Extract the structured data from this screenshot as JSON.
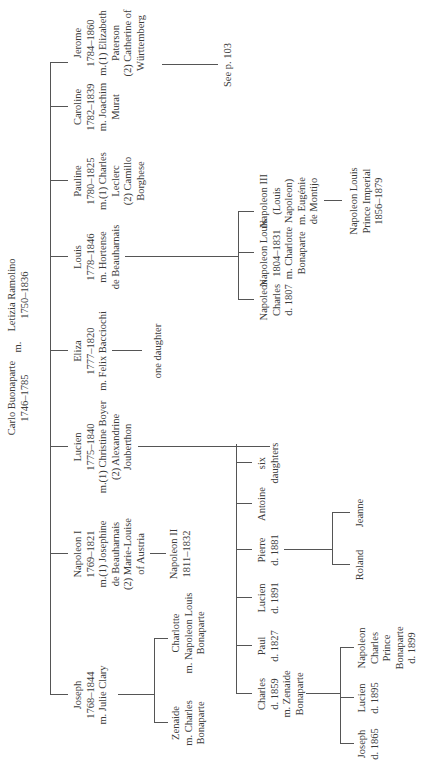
{
  "orientation": "rotated 90 degrees counter-clockwise",
  "parents": {
    "father": {
      "name": "Carlo Buonaparte",
      "dates": "1746–1785"
    },
    "marriage": "m.",
    "mother": {
      "name": "Letizia Ramolino",
      "dates": "1750–1836"
    }
  },
  "children": [
    {
      "id": "joseph",
      "lines": [
        "Joseph",
        "1768–1844",
        "m. Julie Clary"
      ]
    },
    {
      "id": "napoleon1",
      "lines": [
        "Napoleon I",
        "1769–1821",
        "m.(1) Josephine",
        "de Beauharnais",
        "(2) Marie-Louise",
        "of Austria"
      ]
    },
    {
      "id": "lucien",
      "lines": [
        "Lucien",
        "1775–1840",
        "m.(1) Christine Boyer",
        "(2) Alexandrine",
        "Jouberthon"
      ]
    },
    {
      "id": "eliza",
      "lines": [
        "Eliza",
        "1777–1820",
        "m. Felix Bacciochi"
      ]
    },
    {
      "id": "louis",
      "lines": [
        "Louis",
        "1778–1846",
        "m. Hortense",
        "de Beauharnais"
      ]
    },
    {
      "id": "pauline",
      "lines": [
        "Pauline",
        "1780–1825",
        "m.(1) Charles",
        "Leclerc",
        "(2) Camillo",
        "Borghese"
      ]
    },
    {
      "id": "caroline",
      "lines": [
        "Caroline",
        "1782–1839",
        "m. Joachim",
        "Murat"
      ]
    },
    {
      "id": "jerome",
      "lines": [
        "Jerome",
        "1784–1860",
        "m.(1) Elizabeth",
        "Paterson",
        "(2) Catherine of",
        "Württemberg"
      ]
    }
  ],
  "joseph_children": [
    {
      "lines": [
        "Zenaide",
        "m. Charles",
        "Bonaparte"
      ]
    },
    {
      "lines": [
        "Charlotte",
        "m. Napoleon Louis",
        "Bonaparte"
      ]
    }
  ],
  "napoleon1_children": [
    {
      "lines": [
        "Napoleon II",
        "1811–1832"
      ]
    }
  ],
  "lucien_children": [
    {
      "lines": [
        "Charles",
        "d. 1859",
        "m. Zenaide",
        "Bonaparte"
      ]
    },
    {
      "lines": [
        "Paul",
        "d. 1827"
      ]
    },
    {
      "lines": [
        "Lucien",
        "d. 1891"
      ]
    },
    {
      "lines": [
        "Pierre",
        "d. 1881"
      ]
    },
    {
      "lines": [
        "Antoine"
      ]
    },
    {
      "lines": [
        "six",
        "daughters"
      ]
    }
  ],
  "charles_children": [
    {
      "lines": [
        "Joseph",
        "d. 1865"
      ]
    },
    {
      "lines": [
        "Lucien",
        "d. 1895"
      ]
    },
    {
      "lines": [
        "Napoleon",
        "Charles",
        "Prince",
        "Bonaparte",
        "d. 1899"
      ]
    }
  ],
  "pierre_children": [
    {
      "lines": [
        "Roland"
      ]
    },
    {
      "lines": [
        "Jeanne"
      ]
    }
  ],
  "eliza_children": [
    {
      "lines": [
        "one daughter"
      ]
    }
  ],
  "louis_children": [
    {
      "lines": [
        "Napoleon",
        "Charles",
        "d. 1807"
      ]
    },
    {
      "lines": [
        "Napoleon Louis",
        "1804–1831",
        "m. Charlotte",
        "Bonaparte"
      ]
    },
    {
      "lines": [
        "Napoleon III",
        "(Louis",
        "Napoleon)",
        "m. Eugénie",
        "de Montijo"
      ]
    }
  ],
  "napoleon3_children": [
    {
      "lines": [
        "Napoleon Louis",
        "Prince Imperial",
        "1856–1879"
      ]
    }
  ],
  "jerome_reference": "See p. 103"
}
